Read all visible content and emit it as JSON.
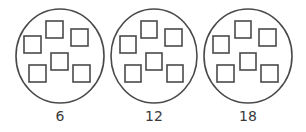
{
  "diagram": {
    "stroke_color": "#4a4a4a",
    "background": "#ffffff",
    "groups": [
      {
        "label": "6",
        "cx": 60,
        "cy": 56,
        "rx": 44,
        "ry": 47,
        "squares": [
          {
            "x": 46,
            "y": 21,
            "w": 17,
            "h": 17
          },
          {
            "x": 71,
            "y": 29,
            "w": 17,
            "h": 17
          },
          {
            "x": 24,
            "y": 36,
            "w": 17,
            "h": 17
          },
          {
            "x": 51,
            "y": 53,
            "w": 17,
            "h": 17
          },
          {
            "x": 29,
            "y": 65,
            "w": 17,
            "h": 17
          },
          {
            "x": 73,
            "y": 65,
            "w": 17,
            "h": 17
          }
        ]
      },
      {
        "label": "12",
        "cx": 154,
        "cy": 56,
        "rx": 43,
        "ry": 47,
        "squares": [
          {
            "x": 141,
            "y": 21,
            "w": 16,
            "h": 17
          },
          {
            "x": 165,
            "y": 29,
            "w": 17,
            "h": 17
          },
          {
            "x": 120,
            "y": 36,
            "w": 16,
            "h": 17
          },
          {
            "x": 146,
            "y": 53,
            "w": 16,
            "h": 17
          },
          {
            "x": 125,
            "y": 65,
            "w": 16,
            "h": 17
          },
          {
            "x": 167,
            "y": 65,
            "w": 16,
            "h": 17
          }
        ]
      },
      {
        "label": "18",
        "cx": 248,
        "cy": 56,
        "rx": 44,
        "ry": 47,
        "squares": [
          {
            "x": 235,
            "y": 21,
            "w": 16,
            "h": 17
          },
          {
            "x": 259,
            "y": 29,
            "w": 17,
            "h": 17
          },
          {
            "x": 213,
            "y": 36,
            "w": 16,
            "h": 17
          },
          {
            "x": 240,
            "y": 53,
            "w": 16,
            "h": 17
          },
          {
            "x": 217,
            "y": 65,
            "w": 17,
            "h": 17
          },
          {
            "x": 261,
            "y": 65,
            "w": 17,
            "h": 17
          }
        ]
      }
    ]
  }
}
